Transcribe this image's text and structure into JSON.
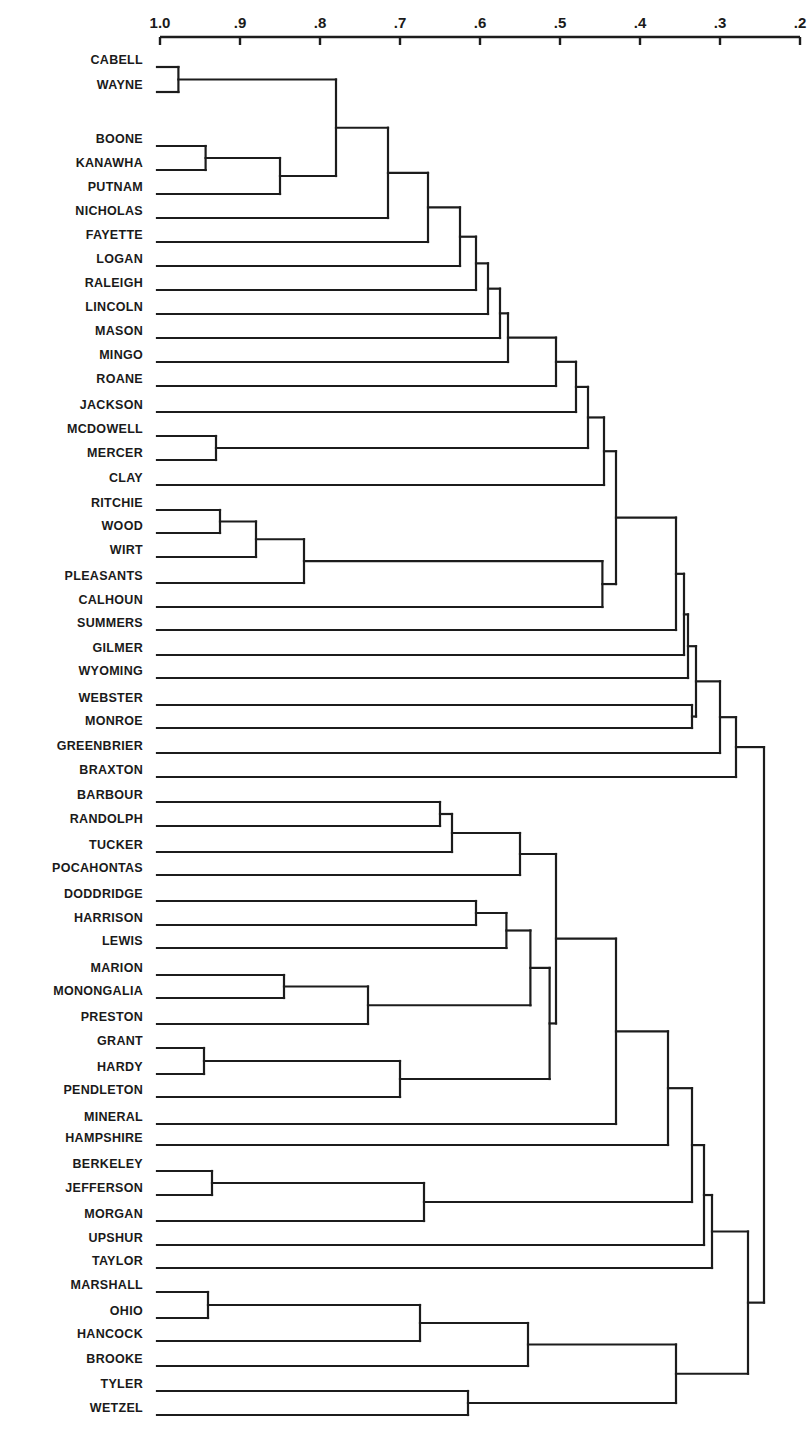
{
  "chart_data": {
    "type": "dendrogram",
    "title": "",
    "xlabel": "",
    "ylabel": "",
    "axis": {
      "position": "top",
      "range": [
        1.0,
        0.2
      ],
      "ticks": [
        {
          "label": "1.0",
          "value": 1.0
        },
        {
          "label": ".9",
          "value": 0.9
        },
        {
          "label": ".8",
          "value": 0.8
        },
        {
          "label": ".7",
          "value": 0.7
        },
        {
          "label": ".6",
          "value": 0.6
        },
        {
          "label": ".5",
          "value": 0.5
        },
        {
          "label": ".4",
          "value": 0.4
        },
        {
          "label": ".3",
          "value": 0.3
        },
        {
          "label": ".2",
          "value": 0.2
        }
      ]
    },
    "leaves": [
      {
        "name": "CABELL",
        "y": 67
      },
      {
        "name": "WAYNE",
        "y": 92
      },
      {
        "name": "BOONE",
        "y": 146
      },
      {
        "name": "KANAWHA",
        "y": 170
      },
      {
        "name": "PUTNAM",
        "y": 194
      },
      {
        "name": "NICHOLAS",
        "y": 218
      },
      {
        "name": "FAYETTE",
        "y": 242
      },
      {
        "name": "LOGAN",
        "y": 266
      },
      {
        "name": "RALEIGH",
        "y": 290
      },
      {
        "name": "LINCOLN",
        "y": 314
      },
      {
        "name": "MASON",
        "y": 338
      },
      {
        "name": "MINGO",
        "y": 362
      },
      {
        "name": "ROANE",
        "y": 386
      },
      {
        "name": "JACKSON",
        "y": 412
      },
      {
        "name": "MCDOWELL",
        "y": 436
      },
      {
        "name": "MERCER",
        "y": 460
      },
      {
        "name": "CLAY",
        "y": 485
      },
      {
        "name": "RITCHIE",
        "y": 510
      },
      {
        "name": "WOOD",
        "y": 533
      },
      {
        "name": "WIRT",
        "y": 557
      },
      {
        "name": "PLEASANTS",
        "y": 583
      },
      {
        "name": "CALHOUN",
        "y": 607
      },
      {
        "name": "SUMMERS",
        "y": 630
      },
      {
        "name": "GILMER",
        "y": 655
      },
      {
        "name": "WYOMING",
        "y": 678
      },
      {
        "name": "WEBSTER",
        "y": 705
      },
      {
        "name": "MONROE",
        "y": 728
      },
      {
        "name": "GREENBRIER",
        "y": 753
      },
      {
        "name": "BRAXTON",
        "y": 777
      },
      {
        "name": "BARBOUR",
        "y": 802
      },
      {
        "name": "RANDOLPH",
        "y": 826
      },
      {
        "name": "TUCKER",
        "y": 852
      },
      {
        "name": "POCAHONTAS",
        "y": 875
      },
      {
        "name": "DODDRIDGE",
        "y": 901
      },
      {
        "name": "HARRISON",
        "y": 925
      },
      {
        "name": "LEWIS",
        "y": 948
      },
      {
        "name": "MARION",
        "y": 975
      },
      {
        "name": "MONONGALIA",
        "y": 998
      },
      {
        "name": "PRESTON",
        "y": 1024
      },
      {
        "name": "GRANT",
        "y": 1048
      },
      {
        "name": "HARDY",
        "y": 1074
      },
      {
        "name": "PENDLETON",
        "y": 1097
      },
      {
        "name": "MINERAL",
        "y": 1124
      },
      {
        "name": "HAMPSHIRE",
        "y": 1145
      },
      {
        "name": "BERKELEY",
        "y": 1171
      },
      {
        "name": "JEFFERSON",
        "y": 1195
      },
      {
        "name": "MORGAN",
        "y": 1221
      },
      {
        "name": "UPSHUR",
        "y": 1245
      },
      {
        "name": "TAYLOR",
        "y": 1268
      },
      {
        "name": "MARSHALL",
        "y": 1292
      },
      {
        "name": "OHIO",
        "y": 1318
      },
      {
        "name": "HANCOCK",
        "y": 1341
      },
      {
        "name": "BROOKE",
        "y": 1366
      },
      {
        "name": "TYLER",
        "y": 1391
      },
      {
        "name": "WETZEL",
        "y": 1415
      }
    ],
    "tree": {
      "s": 0.245,
      "c": [
        {
          "s": 0.28,
          "c": [
            {
              "s": 0.3,
              "c": [
                {
                  "s": 0.33,
                  "c": [
                    {
                      "s": 0.34,
                      "c": [
                        {
                          "s": 0.345,
                          "c": [
                            {
                              "s": 0.355,
                              "c": [
                                {
                                  "s": 0.43,
                                  "c": [
                                    {
                                      "s": 0.445,
                                      "c": [
                                        {
                                          "s": 0.465,
                                          "c": [
                                            {
                                              "s": 0.48,
                                              "c": [
                                                {
                                                  "s": 0.505,
                                                  "c": [
                                                    {
                                                      "s": 0.565,
                                                      "c": [
                                                        {
                                                          "s": 0.575,
                                                          "c": [
                                                            {
                                                              "s": 0.59,
                                                              "c": [
                                                                {
                                                                  "s": 0.605,
                                                                  "c": [
                                                                    {
                                                                      "s": 0.625,
                                                                      "c": [
                                                                        {
                                                                          "s": 0.665,
                                                                          "c": [
                                                                            {
                                                                              "s": 0.715,
                                                                              "c": [
                                                                                {
                                                                                  "s": 0.78,
                                                                                  "c": [
                                                                                    {
                                                                                      "s": 0.977,
                                                                                      "c": [
                                                                                        "CABELL",
                                                                                        "WAYNE"
                                                                                      ]
                                                                                    },
                                                                                    {
                                                                                      "s": 0.85,
                                                                                      "c": [
                                                                                        {
                                                                                          "s": 0.943,
                                                                                          "c": [
                                                                                            "BOONE",
                                                                                            "KANAWHA"
                                                                                          ]
                                                                                        },
                                                                                        "PUTNAM"
                                                                                      ]
                                                                                    }
                                                                                  ]
                                                                                },
                                                                                "NICHOLAS"
                                                                              ]
                                                                            },
                                                                            "FAYETTE"
                                                                          ]
                                                                        },
                                                                        "LOGAN"
                                                                      ]
                                                                    },
                                                                    "RALEIGH"
                                                                  ]
                                                                },
                                                                "LINCOLN"
                                                              ]
                                                            },
                                                            "MASON"
                                                          ]
                                                        },
                                                        "MINGO"
                                                      ]
                                                    },
                                                    "ROANE"
                                                  ]
                                                },
                                                "JACKSON"
                                              ]
                                            },
                                            {
                                              "s": 0.93,
                                              "c": [
                                                "MCDOWELL",
                                                "MERCER"
                                              ]
                                            }
                                          ]
                                        },
                                        "CLAY"
                                      ]
                                    },
                                    {
                                      "s": 0.447,
                                      "c": [
                                        {
                                          "s": 0.82,
                                          "c": [
                                            {
                                              "s": 0.88,
                                              "c": [
                                                {
                                                  "s": 0.925,
                                                  "c": [
                                                    "RITCHIE",
                                                    "WOOD"
                                                  ]
                                                },
                                                "WIRT"
                                              ]
                                            },
                                            "PLEASANTS"
                                          ]
                                        },
                                        "CALHOUN"
                                      ]
                                    }
                                  ]
                                },
                                "SUMMERS"
                              ]
                            },
                            "GILMER"
                          ]
                        },
                        "WYOMING"
                      ]
                    },
                    {
                      "s": 0.335,
                      "c": [
                        "WEBSTER",
                        "MONROE"
                      ]
                    }
                  ]
                },
                "GREENBRIER"
              ]
            },
            "BRAXTON"
          ]
        },
        {
          "s": 0.265,
          "c": [
            {
              "s": 0.31,
              "c": [
                {
                  "s": 0.32,
                  "c": [
                    {
                      "s": 0.335,
                      "c": [
                        {
                          "s": 0.365,
                          "c": [
                            {
                              "s": 0.43,
                              "c": [
                                {
                                  "s": 0.505,
                                  "c": [
                                    {
                                      "s": 0.55,
                                      "c": [
                                        {
                                          "s": 0.635,
                                          "c": [
                                            {
                                              "s": 0.65,
                                              "c": [
                                                "BARBOUR",
                                                "RANDOLPH"
                                              ]
                                            },
                                            "TUCKER"
                                          ]
                                        },
                                        "POCAHONTAS"
                                      ]
                                    },
                                    {
                                      "s": 0.513,
                                      "c": [
                                        {
                                          "s": 0.537,
                                          "c": [
                                            {
                                              "s": 0.567,
                                              "c": [
                                                {
                                                  "s": 0.605,
                                                  "c": [
                                                    "DODDRIDGE",
                                                    "HARRISON"
                                                  ]
                                                },
                                                "LEWIS"
                                              ]
                                            },
                                            {
                                              "s": 0.74,
                                              "c": [
                                                {
                                                  "s": 0.845,
                                                  "c": [
                                                    "MARION",
                                                    "MONONGALIA"
                                                  ]
                                                },
                                                "PRESTON"
                                              ]
                                            }
                                          ]
                                        },
                                        {
                                          "s": 0.7,
                                          "c": [
                                            {
                                              "s": 0.945,
                                              "c": [
                                                "GRANT",
                                                "HARDY"
                                              ]
                                            },
                                            "PENDLETON"
                                          ]
                                        }
                                      ]
                                    }
                                  ]
                                },
                                "MINERAL"
                              ]
                            },
                            "HAMPSHIRE"
                          ]
                        },
                        {
                          "s": 0.67,
                          "c": [
                            {
                              "s": 0.935,
                              "c": [
                                "BERKELEY",
                                "JEFFERSON"
                              ]
                            },
                            "MORGAN"
                          ]
                        }
                      ]
                    },
                    "UPSHUR"
                  ]
                },
                "TAYLOR"
              ]
            },
            {
              "s": 0.355,
              "c": [
                {
                  "s": 0.54,
                  "c": [
                    {
                      "s": 0.675,
                      "c": [
                        {
                          "s": 0.94,
                          "c": [
                            "MARSHALL",
                            "OHIO"
                          ]
                        },
                        "HANCOCK"
                      ]
                    },
                    "BROOKE"
                  ]
                },
                {
                  "s": 0.615,
                  "c": [
                    "TYLER",
                    "WETZEL"
                  ]
                }
              ]
            }
          ]
        }
      ]
    },
    "layout": {
      "x_at_1": 160,
      "px_per_unit": 800,
      "axis_y": 37,
      "leaf_line_start_x": 157
    }
  }
}
